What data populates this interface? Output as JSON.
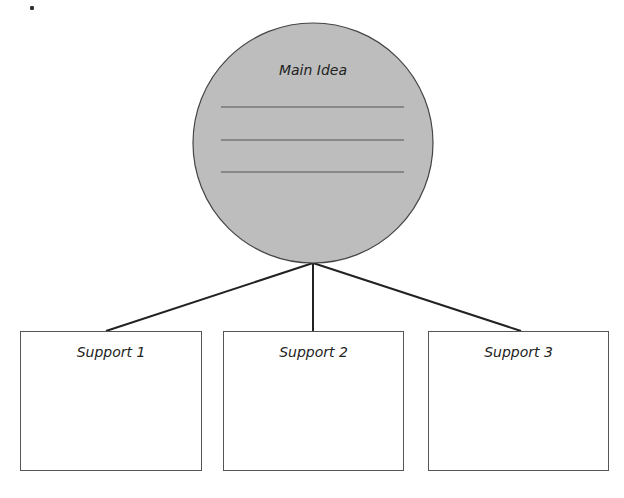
{
  "diagram": {
    "type": "main-idea-graphic-organizer",
    "colors": {
      "circle_fill": "#bdbdbd",
      "stroke": "#333333",
      "box_fill": "#ffffff"
    },
    "main_idea": {
      "label": "Main Idea",
      "blank_lines": 3
    },
    "supports": [
      {
        "label": "Support 1"
      },
      {
        "label": "Support 2"
      },
      {
        "label": "Support 3"
      }
    ]
  }
}
